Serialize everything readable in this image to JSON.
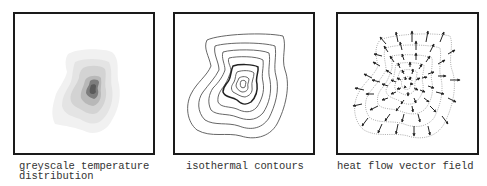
{
  "panels": [
    {
      "id": "greyscale",
      "caption_line1": "greyscale temperature",
      "caption_line2": "distribution",
      "levels": [
        "#f1f1f1",
        "#e2e2e2",
        "#cfcfcf",
        "#b5b5b5",
        "#7a7a7a",
        "#555555"
      ]
    },
    {
      "id": "contours",
      "caption_line1": "isothermal contours",
      "contour_count": 8,
      "stroke_color": "#555555",
      "highlight_stroke_color": "#222222"
    },
    {
      "id": "vectors",
      "caption_line1": "heat flow vector field",
      "arrow_color": "#222222",
      "guide_color": "#888888"
    }
  ]
}
